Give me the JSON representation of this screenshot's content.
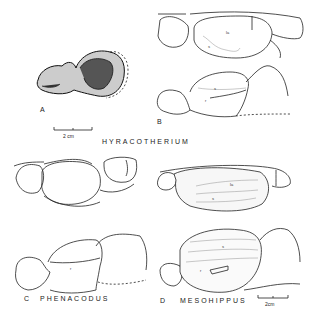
{
  "figure": {
    "panels": [
      {
        "letter": "A",
        "genus": "",
        "description": "fossil brain endocast photo-drawing"
      },
      {
        "letter": "B",
        "genus": "",
        "labels": [
          "la",
          "s",
          "s",
          "r"
        ]
      },
      {
        "letter": "C",
        "genus": "PHENACODUS",
        "labels": [
          "r"
        ]
      },
      {
        "letter": "D",
        "genus": "MESOHIPPUS",
        "labels": [
          "la",
          "s",
          "s",
          "r"
        ]
      }
    ],
    "group_title_AB": "HYRACOTHERIUM",
    "scale_bar_top": "2 cm",
    "scale_bar_bottom": "2cm"
  }
}
